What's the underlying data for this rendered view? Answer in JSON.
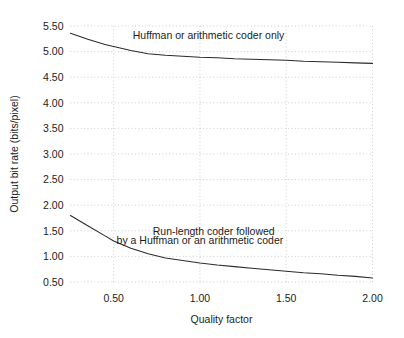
{
  "chart_data": {
    "type": "line",
    "title": "",
    "xlabel": "Quality factor",
    "ylabel": "Output bit rate (bits/pixel)",
    "xlim": [
      0.2,
      2.05
    ],
    "ylim": [
      0.35,
      5.62
    ],
    "grid": true,
    "grid_style": "dotted",
    "legend_position": "inline-annotations",
    "xticks": [
      0.5,
      1.0,
      1.5,
      2.0
    ],
    "xtick_labels": [
      "0.50",
      "1.00",
      "1.50",
      "2.00"
    ],
    "yticks": [
      0.5,
      1.0,
      1.5,
      2.0,
      2.5,
      3.0,
      3.5,
      4.0,
      4.5,
      5.0,
      5.5
    ],
    "ytick_labels": [
      "0.50",
      "1.00",
      "1.50",
      "2.00",
      "2.50",
      "3.00",
      "3.50",
      "4.00",
      "4.50",
      "5.00",
      "5.50"
    ],
    "series": [
      {
        "name": "Huffman or arithmetic coder only",
        "annotation": "Huffman or arithmetic coder only",
        "color": "#2b2b2b",
        "x": [
          0.25,
          0.35,
          0.45,
          0.5,
          0.6,
          0.7,
          0.8,
          0.9,
          1.0,
          1.1,
          1.2,
          1.3,
          1.4,
          1.5,
          1.6,
          1.7,
          1.8,
          1.9,
          2.0
        ],
        "y": [
          5.36,
          5.24,
          5.14,
          5.1,
          5.02,
          4.96,
          4.93,
          4.91,
          4.89,
          4.88,
          4.86,
          4.85,
          4.84,
          4.83,
          4.81,
          4.8,
          4.79,
          4.78,
          4.77
        ]
      },
      {
        "name": "Run-length coder followed by a Huffman or an arithmetic coder",
        "annotation": "Run-length coder followed\nby a Huffman or an arithmetic coder",
        "color": "#2b2b2b",
        "x": [
          0.25,
          0.35,
          0.45,
          0.5,
          0.6,
          0.7,
          0.8,
          0.9,
          1.0,
          1.1,
          1.2,
          1.3,
          1.4,
          1.5,
          1.6,
          1.7,
          1.8,
          1.9,
          2.0
        ],
        "y": [
          1.8,
          1.6,
          1.4,
          1.3,
          1.16,
          1.05,
          0.97,
          0.92,
          0.87,
          0.83,
          0.8,
          0.77,
          0.74,
          0.71,
          0.68,
          0.66,
          0.63,
          0.61,
          0.58
        ]
      }
    ],
    "annotations": [
      {
        "id": "upper-label",
        "text": "Huffman or arithmetic coder only",
        "x": 1.05,
        "y": 5.24
      },
      {
        "id": "lower-label-line1",
        "text": "Run-length coder followed",
        "x": 1.08,
        "y": 1.42
      },
      {
        "id": "lower-label-line2",
        "text": "by a Huffman or an arithmetic coder",
        "x": 1.0,
        "y": 1.24
      }
    ]
  }
}
